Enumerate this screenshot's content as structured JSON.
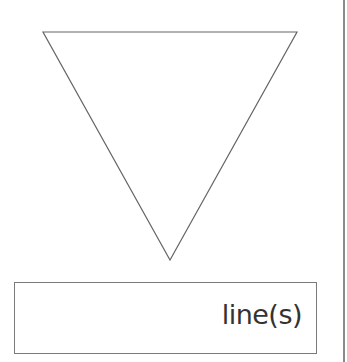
{
  "diagram": {
    "shape": {
      "type": "inverted-triangle",
      "points": [
        [
          43,
          32
        ],
        [
          297,
          32
        ],
        [
          170,
          260
        ]
      ],
      "stroke": "#666666",
      "fill": "#ffffff"
    },
    "label_box": {
      "text": "line(s)"
    },
    "divider": {
      "color": "#8a8a8a"
    }
  }
}
